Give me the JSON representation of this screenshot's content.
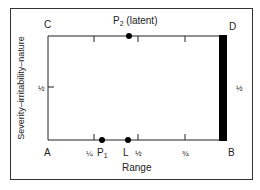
{
  "diagram": {
    "y_axis_label": "Severity–irritability–nature",
    "x_axis_label": "Range",
    "corners": {
      "top_left": "C",
      "top_right": "D",
      "bottom_left": "A",
      "bottom_right": "B"
    },
    "x_ticks": [
      {
        "label": "¼",
        "pos": 0.25
      },
      {
        "label": "½",
        "pos": 0.5
      },
      {
        "label": "¾",
        "pos": 0.75
      }
    ],
    "y_tick_left": {
      "label": "½",
      "pos": 0.5
    },
    "right_bar_label": "½",
    "points": {
      "p1": {
        "name": "P",
        "sub": "1",
        "edge": "bottom",
        "pos": 0.3
      },
      "l": {
        "name": "L",
        "edge": "bottom",
        "pos": 0.45
      },
      "p2": {
        "name": "P",
        "sub": "2",
        "suffix": " (latent)",
        "edge": "top",
        "pos": 0.45
      }
    },
    "colors": {
      "line": "#222222",
      "bar": "#000000",
      "background": "#ffffff"
    }
  }
}
